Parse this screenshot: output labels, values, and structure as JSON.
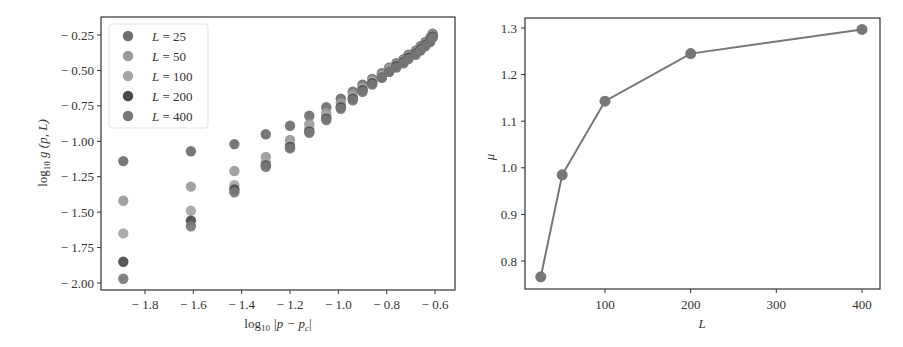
{
  "chart_data": [
    {
      "type": "scatter",
      "title": "",
      "xlabel": "log10 |p − pc|",
      "ylabel": "log10 g(p, L)",
      "xlim": [
        -1.97,
        -0.56
      ],
      "ylim": [
        -2.07,
        -0.16
      ],
      "xticks": [
        -1.8,
        -1.6,
        -1.4,
        -1.2,
        -1.0,
        -0.8,
        -0.6
      ],
      "xtick_labels": [
        "− 1.8",
        "− 1.6",
        "− 1.4",
        "− 1.2",
        "− 1.0",
        "− 0.8",
        "− 0.6"
      ],
      "yticks": [
        -0.25,
        -0.5,
        -0.75,
        -1.0,
        -1.25,
        -1.5,
        -1.75,
        -2.0
      ],
      "ytick_labels": [
        "− 0.25",
        "− 0.50",
        "− 0.75",
        "− 1.00",
        "− 1.25",
        "− 1.50",
        "− 1.75",
        "− 2.00"
      ],
      "grid": false,
      "legend_position": "upper left",
      "x": [
        -1.89,
        -1.61,
        -1.43,
        -1.3,
        -1.2,
        -1.12,
        -1.05,
        -0.99,
        -0.94,
        -0.9,
        -0.86,
        -0.82,
        -0.79,
        -0.76,
        -0.73,
        -0.71,
        -0.68,
        -0.66,
        -0.64,
        -0.62,
        -0.61
      ],
      "series": [
        {
          "name": "L = 25",
          "color": "#6e6e6e",
          "values": [
            -1.14,
            -1.07,
            -1.02,
            -0.95,
            -0.89,
            -0.82,
            -0.76,
            -0.7,
            -0.65,
            -0.6,
            -0.56,
            -0.52,
            -0.48,
            -0.45,
            -0.42,
            -0.39,
            -0.36,
            -0.33,
            -0.3,
            -0.27,
            -0.24
          ]
        },
        {
          "name": "L = 50",
          "color": "#9a9a9a",
          "values": [
            -1.42,
            -1.32,
            -1.21,
            -1.11,
            -0.99,
            -0.88,
            -0.8,
            -0.73,
            -0.67,
            -0.62,
            -0.57,
            -0.53,
            -0.49,
            -0.46,
            -0.43,
            -0.4,
            -0.37,
            -0.34,
            -0.31,
            -0.28,
            -0.25
          ]
        },
        {
          "name": "L = 100",
          "color": "#a5a5a5",
          "values": [
            -1.65,
            -1.49,
            -1.31,
            -1.15,
            -1.02,
            -0.91,
            -0.82,
            -0.75,
            -0.69,
            -0.63,
            -0.58,
            -0.54,
            -0.5,
            -0.47,
            -0.44,
            -0.41,
            -0.38,
            -0.35,
            -0.32,
            -0.29,
            -0.26
          ]
        },
        {
          "name": "L = 200",
          "color": "#4a4a4a",
          "values": [
            -1.85,
            -1.56,
            -1.34,
            -1.17,
            -1.04,
            -0.93,
            -0.84,
            -0.76,
            -0.7,
            -0.64,
            -0.59,
            -0.55,
            -0.51,
            -0.47,
            -0.44,
            -0.41,
            -0.38,
            -0.35,
            -0.32,
            -0.29,
            -0.26
          ]
        },
        {
          "name": "L = 400",
          "color": "#777777",
          "values": [
            -1.97,
            -1.6,
            -1.36,
            -1.18,
            -1.05,
            -0.94,
            -0.85,
            -0.77,
            -0.71,
            -0.65,
            -0.6,
            -0.55,
            -0.51,
            -0.48,
            -0.45,
            -0.42,
            -0.39,
            -0.36,
            -0.33,
            -0.3,
            -0.27
          ]
        }
      ]
    },
    {
      "type": "line",
      "title": "",
      "xlabel": "L",
      "ylabel": "μ",
      "xlim": [
        6,
        419
      ],
      "ylim": [
        0.74,
        1.32
      ],
      "xticks": [
        100,
        200,
        300,
        400
      ],
      "xtick_labels": [
        "100",
        "200",
        "300",
        "400"
      ],
      "yticks": [
        0.8,
        0.9,
        1.0,
        1.1,
        1.2,
        1.3
      ],
      "ytick_labels": [
        "0.8",
        "0.9",
        "1.0",
        "1.1",
        "1.2",
        "1.3"
      ],
      "grid": false,
      "x": [
        25,
        50,
        100,
        200,
        400
      ],
      "series": [
        {
          "name": "mu",
          "color": "#777777",
          "values": [
            0.766,
            0.985,
            1.143,
            1.245,
            1.297
          ]
        }
      ]
    }
  ],
  "left_plot": {
    "xlabel_main": "log",
    "xlabel_sub": "10",
    "xlabel_rest": " |p − p",
    "xlabel_sub2": "c",
    "xlabel_end": "|",
    "ylabel_main": "log",
    "ylabel_sub": "10",
    "ylabel_rest": " g (p, L)",
    "legend": [
      {
        "label": "L = 25",
        "color": "#6e6e6e"
      },
      {
        "label": "L = 50",
        "color": "#9a9a9a"
      },
      {
        "label": "L = 100",
        "color": "#a5a5a5"
      },
      {
        "label": "L = 200",
        "color": "#4a4a4a"
      },
      {
        "label": "L = 400",
        "color": "#777777"
      }
    ]
  },
  "right_plot": {
    "xlabel": "L",
    "ylabel": "μ"
  }
}
